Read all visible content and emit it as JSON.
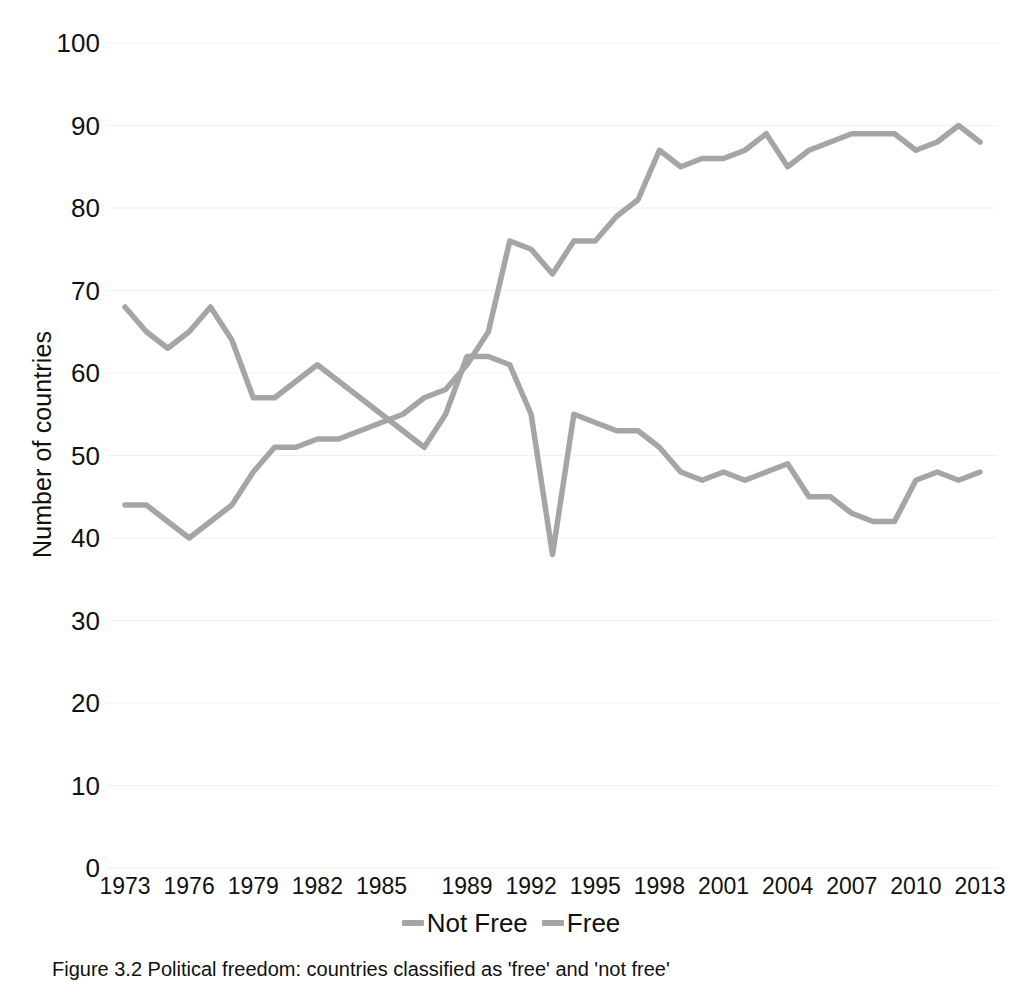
{
  "chart_data": {
    "type": "line",
    "title": "",
    "xlabel": "",
    "ylabel": "Number of countries",
    "ylim": [
      0,
      100
    ],
    "ytick_values": [
      0,
      10,
      20,
      30,
      40,
      50,
      60,
      70,
      80,
      90,
      100
    ],
    "ytick_labels": [
      "0",
      "10",
      "20",
      "30",
      "40",
      "50",
      "60",
      "70",
      "80",
      "90",
      "100"
    ],
    "xlim": [
      1973,
      2013
    ],
    "xtick_labels": [
      "1973",
      "1976",
      "1979",
      "1982",
      "1985",
      "1989",
      "1992",
      "1995",
      "1998",
      "2001",
      "2004",
      "2007",
      "2010",
      "2013"
    ],
    "xtick_values": [
      1973,
      1976,
      1979,
      1982,
      1985,
      1989,
      1992,
      1995,
      1998,
      2001,
      2004,
      2007,
      2010,
      2013
    ],
    "grid": true,
    "grid_axis": "y",
    "legend_position": "bottom",
    "x": [
      1973,
      1974,
      1975,
      1976,
      1977,
      1978,
      1979,
      1980,
      1981,
      1982,
      1983,
      1984,
      1985,
      1986,
      1987,
      1988,
      1989,
      1990,
      1991,
      1992,
      1993,
      1994,
      1995,
      1996,
      1997,
      1998,
      1999,
      2000,
      2001,
      2002,
      2003,
      2004,
      2005,
      2006,
      2007,
      2008,
      2009,
      2010,
      2011,
      2012,
      2013
    ],
    "series": [
      {
        "name": "Not Free",
        "color": "#A5A5A5",
        "values": [
          68,
          65,
          63,
          65,
          68,
          64,
          57,
          57,
          59,
          61,
          59,
          57,
          55,
          53,
          51,
          55,
          62,
          62,
          61,
          55,
          38,
          55,
          54,
          53,
          53,
          51,
          48,
          47,
          48,
          47,
          48,
          49,
          45,
          45,
          43,
          42,
          42,
          47,
          48,
          47,
          48
        ]
      },
      {
        "name": "Free",
        "color": "#A5A5A5",
        "values": [
          44,
          44,
          42,
          40,
          42,
          44,
          48,
          51,
          51,
          52,
          52,
          53,
          54,
          55,
          57,
          58,
          61,
          65,
          76,
          75,
          72,
          76,
          76,
          79,
          81,
          87,
          85,
          86,
          86,
          87,
          89,
          85,
          87,
          88,
          89,
          89,
          89,
          87,
          88,
          90,
          88
        ]
      }
    ],
    "annotations": []
  },
  "legend": {
    "items": [
      {
        "label": "Not Free",
        "color": "#A5A5A5"
      },
      {
        "label": "Free",
        "color": "#A5A5A5"
      }
    ]
  },
  "caption": {
    "text": "Figure 3.2 Political freedom: countries classified as 'free' and 'not free'"
  }
}
